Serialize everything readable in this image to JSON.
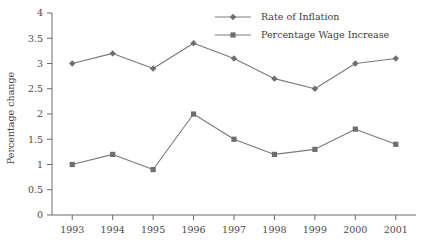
{
  "chart_data": {
    "type": "line",
    "title": "",
    "xlabel": "",
    "ylabel": "Percentage change",
    "categories": [
      "1993",
      "1994",
      "1995",
      "1996",
      "1997",
      "1998",
      "1999",
      "2000",
      "2001"
    ],
    "ylim": [
      0,
      4
    ],
    "ytick_labels": [
      "0",
      "0.5",
      "1",
      "1.5",
      "2",
      "2.5",
      "3",
      "3.5",
      "4"
    ],
    "ytick_values": [
      0,
      0.5,
      1,
      1.5,
      2,
      2.5,
      3,
      3.5,
      4
    ],
    "grid": false,
    "legend_position": "top-right",
    "series": [
      {
        "name": "Rate of Inflation",
        "marker": "diamond",
        "color": "#6e6e6e",
        "values": [
          3.0,
          3.2,
          2.9,
          3.4,
          3.1,
          2.7,
          2.5,
          3.0,
          3.1
        ]
      },
      {
        "name": "Percentage Wage Increase",
        "marker": "square",
        "color": "#6e6e6e",
        "values": [
          1.0,
          1.2,
          0.9,
          2.0,
          1.5,
          1.2,
          1.3,
          1.7,
          1.4
        ]
      }
    ]
  },
  "colors": {
    "axis": "#6b6b6b",
    "line": "#7a7a7a",
    "marker": "#6e6e6e",
    "text": "#3d3d3d",
    "background": "#ffffff"
  }
}
